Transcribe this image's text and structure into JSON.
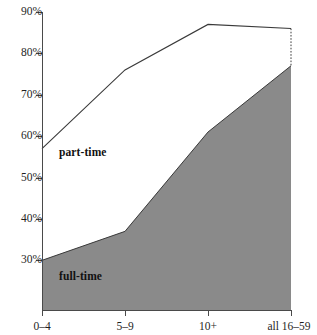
{
  "chart_data": {
    "type": "area",
    "title": "",
    "subtitle": "",
    "xlabel": "",
    "ylabel": "",
    "stacked": false,
    "grid": false,
    "legend_position": "inline-annotation",
    "categories": [
      "0–4",
      "5–9",
      "10+",
      "all 16–59"
    ],
    "ylim": [
      18,
      90
    ],
    "yticks": [
      30,
      40,
      50,
      60,
      70,
      80,
      90
    ],
    "ytick_labels": [
      "30%",
      "40%",
      "50%",
      "60%",
      "70%",
      "80%",
      "90%"
    ],
    "series": [
      {
        "name": "full-time",
        "label": "full-time",
        "values": [
          30,
          37,
          61,
          77
        ],
        "fill_color": "#8a8a8a",
        "line_color": "#3a3a3a",
        "filled": true
      },
      {
        "name": "part-time",
        "label": "part-time",
        "values": [
          57,
          76,
          87,
          86
        ],
        "fill_color": "#ffffff",
        "line_color": "#3a3a3a",
        "filled": false
      }
    ],
    "annotations": [
      {
        "text": "part-time",
        "x_pct": 18.6,
        "y_pct": 43.6
      },
      {
        "text": "full-time",
        "x_pct": 18.6,
        "y_pct": 80.6
      }
    ],
    "dotted_connector": {
      "x_category": "all 16–59",
      "from_value": 86,
      "to_value": 77,
      "color": "#3a3a3a",
      "style": "dotted"
    }
  },
  "axes": {
    "y_axis_name": "percentage-axis",
    "x_axis_name": "category-axis"
  }
}
